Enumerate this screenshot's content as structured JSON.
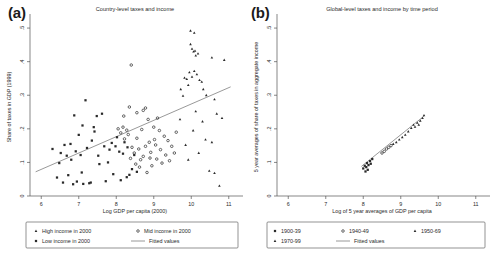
{
  "figure": {
    "panels": [
      {
        "id": "a",
        "label": "(a)",
        "title": "Country-level taxes and income",
        "xlabel": "Log GDP per capita (2000)",
        "ylabel": "Share of taxes in GDP (1999)",
        "xticks": [
          "6",
          "7",
          "8",
          "9",
          "10",
          "11"
        ],
        "yticks": [
          ".5",
          ".4",
          ".3",
          ".2",
          ".1",
          "0"
        ],
        "legend": [
          {
            "marker": "triangle",
            "label": "High income in 2000"
          },
          {
            "marker": "circle",
            "label": "Mid income in 2000"
          },
          {
            "marker": "square",
            "label": "Low income in 2000"
          },
          {
            "marker": "line",
            "label": "Fitted values"
          }
        ]
      },
      {
        "id": "b",
        "label": "(b)",
        "title": "Global-level taxes and income by time period",
        "xlabel": "Log of 5 year averages of GDP per capita",
        "ylabel": "5 year averages of share of taxes in aggregate income",
        "xticks": [
          "6",
          "7",
          "8",
          "9",
          "10",
          "11"
        ],
        "yticks": [
          ".5",
          ".4",
          ".3",
          ".2",
          ".1",
          "0"
        ],
        "legend": [
          {
            "marker": "square",
            "label": "1900-39"
          },
          {
            "marker": "circle",
            "label": "1940-49"
          },
          {
            "marker": "triangle",
            "label": "1950-69"
          },
          {
            "marker": "triangle",
            "label": "1970-99"
          },
          {
            "marker": "line",
            "label": "Fitted values"
          }
        ]
      }
    ]
  },
  "chart_data": [
    {
      "type": "scatter",
      "panel": "a",
      "title": "Country-level taxes and income",
      "xlabel": "Log GDP per capita (2000)",
      "ylabel": "Share of taxes in GDP (1999)",
      "xlim": [
        5.7,
        11.3
      ],
      "ylim": [
        0,
        0.53
      ],
      "grid": false,
      "legend_position": "below",
      "fit_line": {
        "x": [
          5.85,
          11.05
        ],
        "y": [
          0.072,
          0.325
        ]
      },
      "series": [
        {
          "name": "Low income in 2000",
          "marker": "square",
          "points": [
            [
              6.3,
              0.14
            ],
            [
              6.42,
              0.055
            ],
            [
              6.48,
              0.098
            ],
            [
              6.52,
              0.128
            ],
            [
              6.58,
              0.04
            ],
            [
              6.62,
              0.152
            ],
            [
              6.68,
              0.12
            ],
            [
              6.72,
              0.062
            ],
            [
              6.78,
              0.155
            ],
            [
              6.8,
              0.108
            ],
            [
              6.85,
              0.035
            ],
            [
              6.92,
              0.133
            ],
            [
              6.95,
              0.043
            ],
            [
              7.0,
              0.182
            ],
            [
              7.05,
              0.122
            ],
            [
              7.08,
              0.07
            ],
            [
              7.12,
              0.036
            ],
            [
              7.18,
              0.285
            ],
            [
              7.22,
              0.143
            ],
            [
              7.28,
              0.038
            ],
            [
              7.32,
              0.04
            ],
            [
              7.35,
              0.165
            ],
            [
              7.42,
              0.192
            ],
            [
              7.48,
              0.238
            ],
            [
              7.52,
              0.12
            ],
            [
              7.55,
              0.095
            ],
            [
              7.62,
              0.245
            ],
            [
              7.68,
              0.148
            ],
            [
              7.72,
              0.044
            ],
            [
              7.78,
              0.1
            ],
            [
              7.82,
              0.138
            ],
            [
              7.88,
              0.158
            ],
            [
              7.92,
              0.065
            ],
            [
              7.98,
              0.148
            ],
            [
              8.02,
              0.175
            ],
            [
              8.08,
              0.132
            ],
            [
              8.12,
              0.047
            ],
            [
              8.18,
              0.126
            ],
            [
              8.22,
              0.16
            ],
            [
              8.28,
              0.056
            ],
            [
              8.35,
              0.063
            ],
            [
              8.42,
              0.08
            ],
            [
              8.48,
              0.122
            ],
            [
              8.55,
              0.072
            ],
            [
              6.88,
              0.24
            ],
            [
              7.1,
              0.21
            ],
            [
              7.4,
              0.205
            ],
            [
              8.3,
              0.145
            ]
          ]
        },
        {
          "name": "Mid income in 2000",
          "marker": "circle",
          "points": [
            [
              8.05,
              0.2
            ],
            [
              8.12,
              0.188
            ],
            [
              8.18,
              0.205
            ],
            [
              8.22,
              0.17
            ],
            [
              8.28,
              0.196
            ],
            [
              8.32,
              0.183
            ],
            [
              8.38,
              0.112
            ],
            [
              8.42,
              0.145
            ],
            [
              8.48,
              0.128
            ],
            [
              8.52,
              0.095
            ],
            [
              8.55,
              0.172
            ],
            [
              8.6,
              0.14
            ],
            [
              8.62,
              0.086
            ],
            [
              8.68,
              0.198
            ],
            [
              8.72,
              0.118
            ],
            [
              8.78,
              0.148
            ],
            [
              8.82,
              0.07
            ],
            [
              8.85,
              0.228
            ],
            [
              8.88,
              0.16
            ],
            [
              8.92,
              0.13
            ],
            [
              8.95,
              0.09
            ],
            [
              9.0,
              0.205
            ],
            [
              9.05,
              0.152
            ],
            [
              9.08,
              0.11
            ],
            [
              9.15,
              0.195
            ],
            [
              9.18,
              0.138
            ],
            [
              9.22,
              0.098
            ],
            [
              9.28,
              0.178
            ],
            [
              9.32,
              0.122
            ],
            [
              9.38,
              0.165
            ],
            [
              9.42,
              0.105
            ],
            [
              9.48,
              0.148
            ],
            [
              9.55,
              0.128
            ],
            [
              9.6,
              0.19
            ],
            [
              8.35,
              0.265
            ],
            [
              8.55,
              0.248
            ],
            [
              8.72,
              0.255
            ],
            [
              8.78,
              0.262
            ],
            [
              9.1,
              0.232
            ],
            [
              8.4,
              0.39
            ],
            [
              8.2,
              0.238
            ],
            [
              9.02,
              0.168
            ],
            [
              8.65,
              0.108
            ],
            [
              8.9,
              0.113
            ]
          ]
        },
        {
          "name": "High income in 2000",
          "marker": "triangle",
          "points": [
            [
              9.98,
              0.492
            ],
            [
              10.08,
              0.486
            ],
            [
              9.98,
              0.452
            ],
            [
              10.02,
              0.438
            ],
            [
              10.06,
              0.43
            ],
            [
              10.1,
              0.432
            ],
            [
              10.12,
              0.418
            ],
            [
              10.18,
              0.424
            ],
            [
              10.55,
              0.412
            ],
            [
              10.88,
              0.405
            ],
            [
              9.82,
              0.352
            ],
            [
              9.88,
              0.348
            ],
            [
              9.95,
              0.368
            ],
            [
              10.02,
              0.355
            ],
            [
              10.08,
              0.372
            ],
            [
              10.15,
              0.362
            ],
            [
              10.22,
              0.345
            ],
            [
              9.92,
              0.33
            ],
            [
              10.28,
              0.34
            ],
            [
              10.32,
              0.318
            ],
            [
              10.4,
              0.3
            ],
            [
              9.72,
              0.318
            ],
            [
              9.78,
              0.298
            ],
            [
              10.62,
              0.288
            ],
            [
              10.68,
              0.245
            ],
            [
              10.82,
              0.232
            ],
            [
              9.7,
              0.228
            ],
            [
              10.05,
              0.195
            ],
            [
              10.38,
              0.168
            ],
            [
              10.55,
              0.16
            ],
            [
              9.85,
              0.152
            ],
            [
              10.2,
              0.128
            ],
            [
              10.48,
              0.075
            ],
            [
              10.62,
              0.068
            ],
            [
              10.75,
              0.03
            ],
            [
              9.92,
              0.108
            ],
            [
              10.3,
              0.222
            ],
            [
              10.12,
              0.252
            ]
          ]
        }
      ]
    },
    {
      "type": "scatter",
      "panel": "b",
      "title": "Global-level taxes and income by time period",
      "xlabel": "Log of 5 year averages of GDP per capita",
      "ylabel": "5 year averages of share of taxes in aggregate income",
      "xlim": [
        5.7,
        11.3
      ],
      "ylim": [
        0,
        0.53
      ],
      "grid": false,
      "legend_position": "below",
      "fit_line": {
        "x": [
          7.95,
          9.62
        ],
        "y": [
          0.088,
          0.238
        ]
      },
      "series": [
        {
          "name": "1900-39",
          "marker": "square",
          "points": [
            [
              8.0,
              0.082
            ],
            [
              8.04,
              0.09
            ],
            [
              8.08,
              0.086
            ],
            [
              8.1,
              0.098
            ],
            [
              8.14,
              0.092
            ],
            [
              8.18,
              0.104
            ],
            [
              8.2,
              0.096
            ],
            [
              8.24,
              0.11
            ],
            [
              8.12,
              0.078
            ],
            [
              8.06,
              0.073
            ]
          ]
        },
        {
          "name": "1940-49",
          "marker": "circle",
          "points": [
            [
              8.5,
              0.128
            ],
            [
              8.56,
              0.133
            ],
            [
              8.62,
              0.14
            ],
            [
              8.68,
              0.145
            ],
            [
              8.74,
              0.15
            ]
          ]
        },
        {
          "name": "1950-69",
          "marker": "triangle",
          "points": [
            [
              8.8,
              0.155
            ],
            [
              8.88,
              0.16
            ],
            [
              8.96,
              0.168
            ],
            [
              9.04,
              0.175
            ],
            [
              9.12,
              0.182
            ]
          ]
        },
        {
          "name": "1970-99",
          "marker": "triangle",
          "points": [
            [
              9.2,
              0.192
            ],
            [
              9.28,
              0.202
            ],
            [
              9.34,
              0.212
            ],
            [
              9.38,
              0.206
            ],
            [
              9.44,
              0.218
            ],
            [
              9.48,
              0.212
            ],
            [
              9.52,
              0.224
            ],
            [
              9.58,
              0.232
            ],
            [
              9.62,
              0.24
            ]
          ]
        }
      ]
    }
  ]
}
